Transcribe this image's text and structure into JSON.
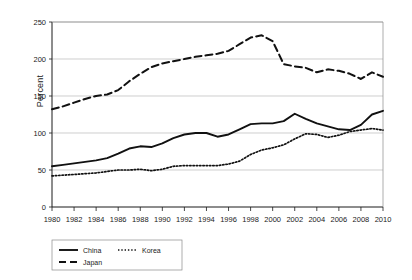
{
  "chart_data": {
    "type": "line",
    "title": "",
    "xlabel": "",
    "ylabel": "Percent",
    "xlim": [
      1980,
      2010
    ],
    "ylim": [
      0,
      250
    ],
    "yticks": [
      0,
      50,
      100,
      150,
      200,
      250
    ],
    "xticks": [
      1980,
      1982,
      1984,
      1986,
      1988,
      1990,
      1992,
      1994,
      1996,
      1998,
      2000,
      2002,
      2004,
      2006,
      2008,
      2010
    ],
    "grid": "horizontal",
    "legend_position": "bottom-left",
    "x": [
      1980,
      1981,
      1982,
      1983,
      1984,
      1985,
      1986,
      1987,
      1988,
      1989,
      1990,
      1991,
      1992,
      1993,
      1994,
      1995,
      1996,
      1997,
      1998,
      1999,
      2000,
      2001,
      2002,
      2003,
      2004,
      2005,
      2006,
      2007,
      2008,
      2009,
      2010
    ],
    "series": [
      {
        "name": "China",
        "style": "solid",
        "color": "#111111",
        "values": [
          55,
          57,
          59,
          61,
          63,
          66,
          72,
          79,
          82,
          81,
          86,
          93,
          98,
          100,
          100,
          95,
          98,
          105,
          112,
          113,
          113,
          116,
          126,
          119,
          113,
          109,
          105,
          104,
          111,
          125,
          130
        ]
      },
      {
        "name": "Japan",
        "style": "dashed",
        "color": "#111111",
        "values": [
          132,
          136,
          141,
          146,
          150,
          152,
          158,
          170,
          180,
          189,
          194,
          197,
          200,
          203,
          205,
          207,
          211,
          220,
          229,
          232,
          224,
          193,
          190,
          188,
          182,
          186,
          184,
          180,
          173,
          182,
          176
        ]
      },
      {
        "name": "Korea",
        "style": "dotted",
        "color": "#111111",
        "values": [
          42,
          43,
          44,
          45,
          46,
          48,
          50,
          50,
          51,
          49,
          51,
          55,
          56,
          56,
          56,
          56,
          58,
          62,
          71,
          77,
          80,
          84,
          92,
          99,
          98,
          94,
          97,
          102,
          104,
          106,
          104
        ]
      }
    ]
  },
  "legend": {
    "items": [
      {
        "label": "China",
        "style": "solid"
      },
      {
        "label": "Korea",
        "style": "dotted"
      },
      {
        "label": "Japan",
        "style": "dashed"
      }
    ]
  }
}
